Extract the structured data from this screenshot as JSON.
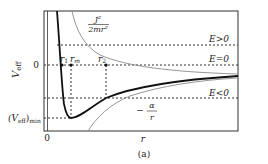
{
  "figure": {
    "caption": "(a)",
    "y_axis_label": "V",
    "y_axis_label_sub": "eff",
    "x_axis_label": "r",
    "origin_label": "0",
    "y_zero_label": "0",
    "vmin_label_main": "(V",
    "vmin_label_sub": "eff",
    "vmin_label_close": ")",
    "vmin_label_subscript": "min",
    "centrifugal_label_num": "J²",
    "centrifugal_label_den": "2mr²",
    "coulomb_label_num": "α",
    "coulomb_label_den": "r",
    "coulomb_label_sign": "−",
    "r_markers": {
      "r1": "r",
      "r1_sub": "1",
      "rm": "r",
      "rm_sub": "m",
      "r2": "r",
      "r2_sub": "2"
    },
    "energy_levels": [
      {
        "label": "E > 0",
        "text": "E>0"
      },
      {
        "label": "E = 0",
        "text": "E=0"
      },
      {
        "label": "E < 0",
        "text": "E<0"
      }
    ]
  },
  "colors": {
    "frame": "#333333",
    "veff_curve": "#111111",
    "component_curves": "#8a8a8a",
    "dashed": "#333333"
  }
}
